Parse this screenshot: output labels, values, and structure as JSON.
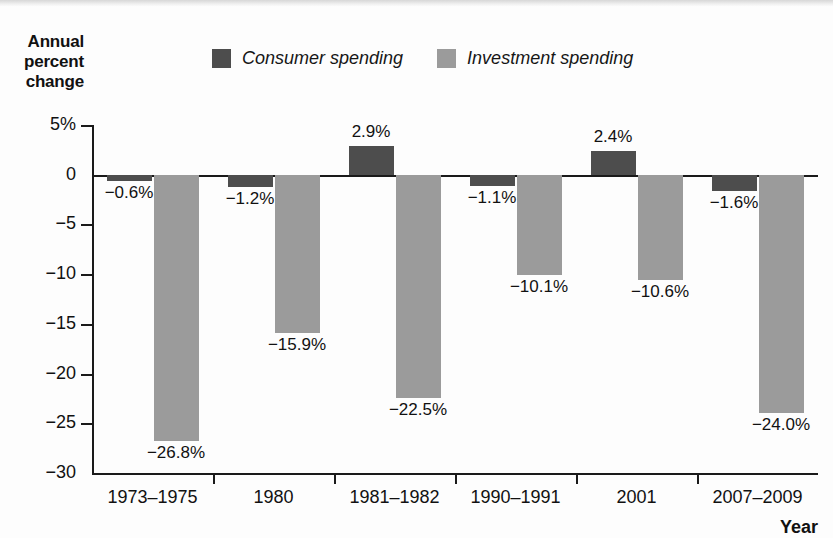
{
  "chart_data": {
    "type": "bar",
    "title": "",
    "ylabel": "Annual percent change",
    "xlabel": "Year",
    "categories": [
      "1973–1975",
      "1980",
      "1981–1982",
      "1990–1991",
      "2001",
      "2007–2009"
    ],
    "series": [
      {
        "name": "Consumer spending",
        "color": "#4d4d4d",
        "values": [
          -0.6,
          -1.2,
          2.9,
          -1.1,
          2.4,
          -1.6
        ],
        "labels": [
          "−0.6%",
          "−1.2%",
          "2.9%",
          "−1.1%",
          "2.4%",
          "−1.6%"
        ]
      },
      {
        "name": "Investment spending",
        "color": "#9b9b9b",
        "values": [
          -26.8,
          -15.9,
          -22.5,
          -10.1,
          -10.6,
          -24.0
        ],
        "labels": [
          "−26.8%",
          "−15.9%",
          "−22.5%",
          "−10.1%",
          "−10.6%",
          "−24.0%"
        ]
      }
    ],
    "ylim": [
      -30,
      5
    ],
    "yticks": [
      5,
      0,
      -5,
      -10,
      -15,
      -20,
      -25,
      -30
    ],
    "ytick_labels": [
      "5%",
      "0",
      "−5",
      "−10",
      "−15",
      "−20",
      "−25",
      "−30"
    ],
    "grid": false,
    "legend_position": "top-center",
    "zero_line": true
  },
  "legend": {
    "items": [
      {
        "label": "Consumer spending",
        "swatch": "#4d4d4d"
      },
      {
        "label": "Investment spending",
        "swatch": "#9b9b9b"
      }
    ]
  },
  "axes": {
    "y_title": "Annual percent change",
    "x_title": "Year"
  }
}
